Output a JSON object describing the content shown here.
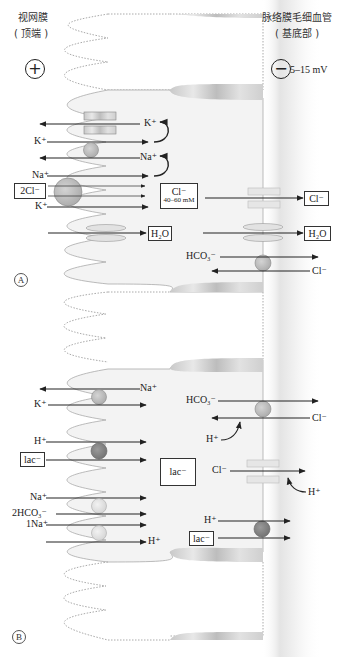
{
  "header": {
    "apical_label": "视网膜",
    "apical_sub": "( 顶端 )",
    "basal_label": "脉络膜毛细血管",
    "basal_sub": "( 基底部 )",
    "apical_sign": "+",
    "basal_sign": "−",
    "potential": "5–15 mV"
  },
  "panel_a": {
    "letter": "A",
    "apical_ions": {
      "k_out": "K⁺",
      "k_in": "K⁺",
      "na_out": "Na⁺",
      "na_in": "Na⁺",
      "cl2": "2Cl⁻",
      "k_in2": "K⁺"
    },
    "intracellular_cl": "Cl⁻",
    "intracellular_cl_conc": "40–60 mM",
    "apical_h2o": "H₂O",
    "basal_ions": {
      "cl_out": "Cl⁻",
      "h2o_out": "H₂O",
      "hco3": "HCO₃⁻",
      "cl_in": "Cl⁻"
    }
  },
  "panel_b": {
    "letter": "B",
    "apical_ions": {
      "na_out": "Na⁺",
      "k_in": "K⁺",
      "h_in": "H⁺",
      "lac": "lac⁻",
      "na_in": "Na⁺",
      "hco3_2": "2HCO₃⁻",
      "na_1": "1Na⁺",
      "h_out": "H⁺"
    },
    "intracellular_lac": "lac⁻",
    "basal_ions": {
      "hco3": "HCO₃⁻",
      "cl_in": "Cl⁻",
      "h_plus": "H⁺",
      "cl_chan": "Cl⁻",
      "h_plus2": "H⁺",
      "h_out": "H⁺",
      "lac_out": "lac⁻"
    }
  },
  "colors": {
    "cell_fill": "#f1f1f1",
    "membrane": "#aaaaaa",
    "transporter": "#b8b8b8",
    "transporter_dark": "#8a8a8a",
    "transporter_light": "#dedede",
    "arrow": "#222222"
  }
}
